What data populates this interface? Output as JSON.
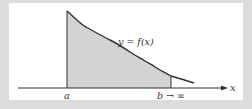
{
  "diagram": {
    "curve_label": "y = f(x)",
    "x_axis_label": "x",
    "lower_bound_label": "a",
    "upper_bound_label": "b → ∞",
    "colors": {
      "frame": "#dcdcdc",
      "panel": "#ffffff",
      "shaded_region": "#d3d3d3",
      "curve": "#333333",
      "axis": "#333333",
      "text": "#333333"
    },
    "geometry": {
      "axis_y": 88,
      "axis_x_start": 18,
      "axis_x_end": 228,
      "a_x": 67,
      "b_x": 171,
      "curve_points": [
        [
          67,
          11
        ],
        [
          86,
          27
        ],
        [
          110,
          40
        ],
        [
          130,
          52
        ],
        [
          145,
          61
        ],
        [
          155,
          67
        ],
        [
          171,
          76
        ],
        [
          185,
          80
        ],
        [
          194,
          83
        ]
      ]
    }
  }
}
